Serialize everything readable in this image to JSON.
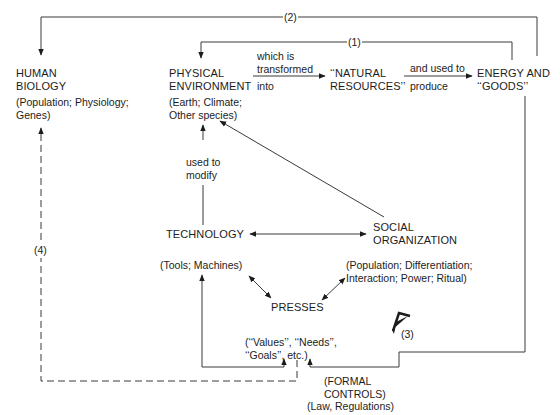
{
  "diagram": {
    "nodes": {
      "human_biology": {
        "title": "HUMAN\nBIOLOGY",
        "detail": "(Population; Physiology;\nGenes)"
      },
      "physical_environment": {
        "title": "PHYSICAL\nENVIRONMENT",
        "detail": "(Earth; Climate;\nOther species)"
      },
      "natural_resources": {
        "title": "‘‘NATURAL\nRESOURCES’’"
      },
      "energy_goods": {
        "title": "ENERGY AND\n‘‘GOODS’’"
      },
      "technology": {
        "title": "TECHNOLOGY",
        "detail": "(Tools; Machines)"
      },
      "social_organization": {
        "title": "SOCIAL\nORGANIZATION",
        "detail": "(Population; Differentiation;\nInteraction; Power; Ritual)"
      },
      "presses": {
        "title": "PRESSES",
        "detail": "(‘‘Values’’, ‘‘Needs’’,\n‘‘Goals’’, etc.)"
      },
      "formal_controls": {
        "title": "(FORMAL\nCONTROLS)",
        "detail": "(Law, Regulations)"
      }
    },
    "edge_labels": {
      "transformed_top": "which is\ntransformed",
      "transformed_bottom": "into",
      "used_top": "and used to",
      "used_bottom": "produce",
      "modify": "used to\nmodify",
      "loop1": "(1)",
      "loop2": "(2)",
      "loop3": "(3)",
      "loop4": "(4)"
    }
  }
}
